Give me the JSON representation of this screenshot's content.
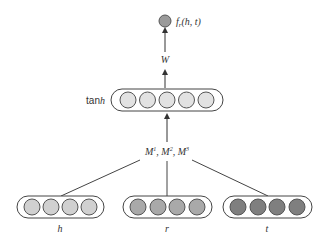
{
  "diagram": {
    "output": {
      "label_main": "f",
      "label_sub": "r",
      "label_args": "(h, t)",
      "color": "#9a9a9a"
    },
    "weight_label": "W",
    "hidden_layer": {
      "label_prefix": "tan",
      "label_var": "h",
      "units": 5,
      "color": "#e2e2e2"
    },
    "tensor_label": {
      "parts": [
        "M",
        "1",
        ", M",
        "2",
        ", M",
        "3"
      ]
    },
    "inputs": [
      {
        "label": "h",
        "units": 4,
        "color": "#d0d0d0"
      },
      {
        "label": "r",
        "units": 4,
        "color": "#a9a9a9"
      },
      {
        "label": "t",
        "units": 4,
        "color": "#7f7f7f"
      }
    ],
    "colors": {
      "stroke": "#444444",
      "text": "#333333"
    }
  }
}
